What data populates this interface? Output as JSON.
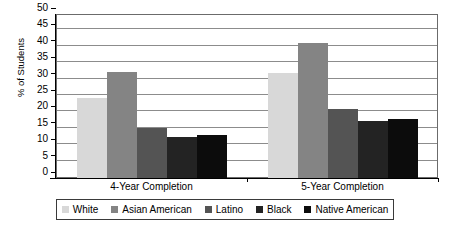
{
  "chart_data": {
    "type": "bar",
    "title": "",
    "xlabel": "",
    "ylabel": "% of Students",
    "ylim": [
      0,
      50
    ],
    "yticks": [
      0,
      5,
      10,
      15,
      20,
      25,
      30,
      35,
      40,
      45,
      50
    ],
    "grid": true,
    "legend_position": "bottom",
    "categories": [
      "4-Year Completion",
      "5-Year Completion"
    ],
    "series": [
      {
        "name": "White",
        "color": "#d8d8d8",
        "values": [
          24.5,
          32.0
        ]
      },
      {
        "name": "Asian American",
        "color": "#848484",
        "values": [
          32.2,
          41.2
        ]
      },
      {
        "name": "Latino",
        "color": "#545454",
        "values": [
          15.2,
          21.0
        ]
      },
      {
        "name": "Black",
        "color": "#232323",
        "values": [
          12.5,
          17.5
        ]
      },
      {
        "name": "Native American",
        "color": "#0c0c0c",
        "values": [
          13.2,
          18.0
        ]
      }
    ]
  },
  "axis": {
    "y_title": "% of Students",
    "y_tick_labels": [
      "50",
      "45",
      "40",
      "35",
      "30",
      "25",
      "20",
      "15",
      "10",
      "5",
      "0"
    ],
    "x_tick_labels": [
      "4-Year Completion",
      "5-Year Completion"
    ]
  },
  "legend": {
    "items": [
      {
        "label": "White",
        "color": "#d8d8d8"
      },
      {
        "label": "Asian American",
        "color": "#848484"
      },
      {
        "label": "Latino",
        "color": "#545454"
      },
      {
        "label": "Black",
        "color": "#232323"
      },
      {
        "label": "Native American",
        "color": "#0c0c0c"
      }
    ]
  }
}
